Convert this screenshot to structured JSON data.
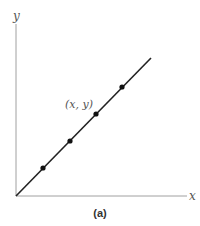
{
  "figure": {
    "caption": "(a)",
    "axes": {
      "x_label": "x",
      "y_label": "y"
    },
    "point_label": "(x, y)",
    "colors": {
      "line": "#222222",
      "axis": "#999999",
      "point": "#111111"
    }
  },
  "diagram": {
    "type": "linear-relationship",
    "line": {
      "from": [
        0,
        0
      ],
      "to": [
        1,
        1
      ]
    },
    "points": [
      {
        "x": 0.2,
        "y": 0.2
      },
      {
        "x": 0.4,
        "y": 0.4
      },
      {
        "x": 0.6,
        "y": 0.6,
        "label": "(x, y)"
      },
      {
        "x": 0.8,
        "y": 0.8
      }
    ]
  }
}
